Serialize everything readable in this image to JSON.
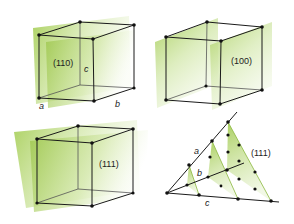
{
  "colors": {
    "plane": "#9cc64a",
    "plane_light": "#e6f1cf",
    "edge": "#1a1a1a",
    "dot": "#111111"
  },
  "panels": [
    {
      "id": "cube-110",
      "plane_label": "(110)",
      "axis_labels": {
        "a": "a",
        "b": "b",
        "c": "c"
      }
    },
    {
      "id": "cube-100",
      "plane_label": "(100)"
    },
    {
      "id": "cube-111",
      "plane_label": "(111)"
    },
    {
      "id": "lattice-111",
      "plane_label": "(111)",
      "axis_labels": {
        "a": "a",
        "b": "b",
        "c": "c"
      }
    }
  ]
}
